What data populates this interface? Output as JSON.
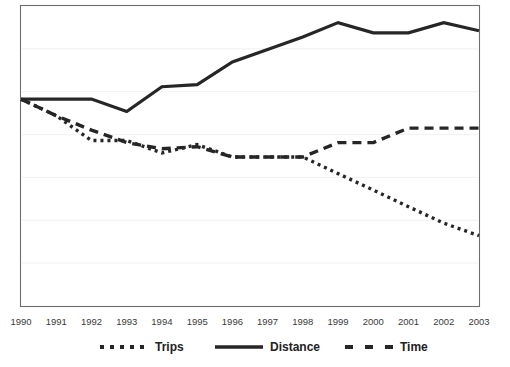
{
  "chart_data": {
    "type": "line",
    "title": "",
    "subtitle": "",
    "xlabel": "",
    "ylabel": "",
    "grid": true,
    "legend_position": "bottom",
    "axis": {
      "x_range": [
        1990,
        2003
      ],
      "y_visible_ticks": false,
      "y_index_range": [
        0,
        100
      ]
    },
    "categories": [
      "1990",
      "1991",
      "1992",
      "1993",
      "1994",
      "1995",
      "1996",
      "1997",
      "1998",
      "1999",
      "2000",
      "2001",
      "2002",
      "2003"
    ],
    "series": [
      {
        "name": "Trips",
        "style": "dotted",
        "color": "#262626",
        "values": [
          100,
          92,
          80,
          80,
          74,
          78,
          72,
          72,
          72,
          64,
          56,
          48,
          40,
          34
        ]
      },
      {
        "name": "Distance",
        "style": "solid",
        "color": "#262626",
        "values": [
          100,
          100,
          100,
          94,
          106,
          107,
          118,
          124,
          130,
          137,
          132,
          132,
          137,
          133
        ]
      },
      {
        "name": "Time",
        "style": "dashed",
        "color": "#262626",
        "values": [
          100,
          92,
          85,
          79,
          76,
          77,
          72,
          72,
          72,
          79,
          79,
          86,
          86,
          86
        ]
      }
    ]
  },
  "axis_labels": {
    "x_ticks": [
      "1990",
      "1991",
      "1992",
      "1993",
      "1994",
      "1995",
      "1996",
      "1997",
      "1998",
      "1999",
      "2000",
      "2001",
      "2002",
      "2003"
    ]
  },
  "legend": {
    "items": [
      {
        "label": "Trips",
        "style": "dotted"
      },
      {
        "label": "Distance",
        "style": "solid"
      },
      {
        "label": "Time",
        "style": "dashed"
      }
    ]
  }
}
